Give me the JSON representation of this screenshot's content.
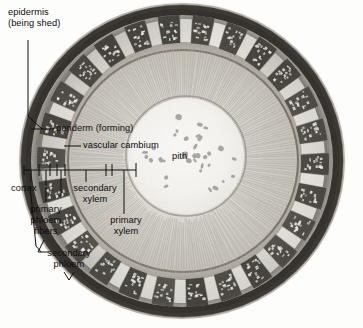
{
  "figure": {
    "kind": "light-micrograph",
    "palette": {
      "background": "#fdfdfc",
      "ink": "#101010",
      "periderm_dark": "#3a3733",
      "cortex_mid": "#9a958c",
      "fiber_cap": "#4a4640",
      "xylem_light": "#cfcbc2",
      "pith_white": "#f7f6f3",
      "ray_line": "#b4afa5"
    }
  },
  "labels": {
    "epidermis": {
      "line1": "epidermis",
      "line2": "(being shed)"
    },
    "periderm": "periderm (forming)",
    "vascular_cambium": "vascular cambium",
    "pith": "pith",
    "cortex": "cortex",
    "primary_phloem_fibers": {
      "line1": "primary",
      "line2": "phloem",
      "line3": "fibers"
    },
    "secondary_phloem": {
      "line1": "secondary",
      "line2": "phloem"
    },
    "secondary_xylem": {
      "line1": "secondary",
      "line2": "xylem"
    },
    "primary_xylem": {
      "line1": "primary",
      "line2": "xylem"
    }
  },
  "tissue_zones": [
    {
      "name": "epidermis",
      "order": 1
    },
    {
      "name": "periderm",
      "order": 2
    },
    {
      "name": "cortex",
      "order": 3
    },
    {
      "name": "primary phloem fibers",
      "order": 4
    },
    {
      "name": "secondary phloem",
      "order": 5
    },
    {
      "name": "vascular cambium",
      "order": 6
    },
    {
      "name": "secondary xylem",
      "order": 7
    },
    {
      "name": "primary xylem",
      "order": 8
    },
    {
      "name": "pith",
      "order": 9
    }
  ]
}
